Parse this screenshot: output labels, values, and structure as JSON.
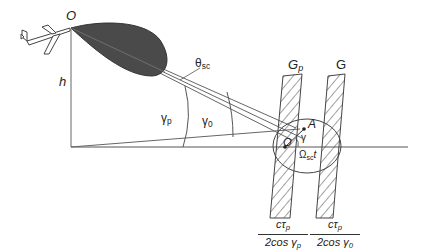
{
  "diagram": {
    "type": "geometry",
    "labels": {
      "origin": "O",
      "height": "h",
      "beamwidth": "θ",
      "beamwidth_sub": "sc",
      "gamma_p": "γ",
      "gamma_p_sub": "p",
      "gamma_0": "γ",
      "gamma_0_sub": "0",
      "strip_p": "G",
      "strip_p_sub": "p",
      "strip": "G",
      "point_a": "A",
      "gamma": "γ",
      "center": "O",
      "rotation": "Ω",
      "rotation_sub": "sc",
      "rotation_t": "t"
    },
    "fractions": [
      {
        "num_main": "cτ",
        "num_sub": "p",
        "den_main": "2cos γ",
        "den_sub": "p"
      },
      {
        "num_main": "cτ",
        "num_sub": "p",
        "den_main": "2cos γ",
        "den_sub": "0"
      }
    ],
    "colors": {
      "line": "#555555",
      "lobe_fill": "#4a4a4a",
      "hatch": "#444444"
    }
  }
}
